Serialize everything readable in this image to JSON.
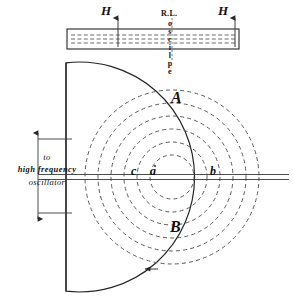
{
  "figure": {
    "stroke_color": "#262626",
    "dash_color": "#555555",
    "background": "#ffffff"
  },
  "labels": {
    "field_left": "H",
    "field_right": "H",
    "plate_abbrev": "R.L.",
    "plate_vertical": "oscilpe",
    "oscillator_line1": "to",
    "oscillator_line2": "high frequency",
    "oscillator_line3": "oscillator",
    "region_upper": "A",
    "region_lower": "B",
    "point_c": "c",
    "point_a": "a",
    "point_b": "b"
  },
  "geometry": {
    "plate": {
      "x": 67,
      "y": 29,
      "width": 172,
      "height": 20
    },
    "vessel": {
      "center_x": 172,
      "center_y": 177,
      "radius": 115,
      "flat_left_x": 66
    },
    "axis_y": 177,
    "rings_count": 6,
    "ring_radii": [
      22,
      35,
      48,
      61,
      74,
      87
    ],
    "arrow_field_left_x": 118,
    "arrow_field_right_x": 235,
    "rotation_arrow": {
      "x": 147,
      "y": 269,
      "direction": "left"
    }
  }
}
